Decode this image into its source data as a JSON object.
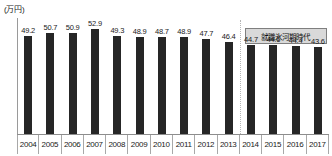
{
  "chart_data": {
    "type": "bar",
    "title": "",
    "subtitle": "",
    "xlabel": "",
    "ylabel": "",
    "unit_label": "(万円)",
    "categories": [
      "2004",
      "2005",
      "2006",
      "2007",
      "2008",
      "2009",
      "2010",
      "2011",
      "2012",
      "2013",
      "2014",
      "2015",
      "2016",
      "2017"
    ],
    "values": [
      49.2,
      50.7,
      50.9,
      52.9,
      49.3,
      48.9,
      48.7,
      48.9,
      47.7,
      46.4,
      44.7,
      44.6,
      44.4,
      43.6
    ],
    "value_labels": [
      "49.2",
      "50.7",
      "50.9",
      "52.9",
      "49.3",
      "48.9",
      "48.7",
      "48.9",
      "47.7",
      "46.4",
      "44.7",
      "44.6",
      "44.4",
      "43.6"
    ],
    "ylim": [
      0,
      52.9
    ],
    "grid": false,
    "legend": false,
    "bar_color": "#262626",
    "annotations": [
      {
        "text": "就職氷河期時代",
        "kind": "callout-box",
        "spans_categories": [
          "2014",
          "2017"
        ]
      }
    ],
    "dividers": [
      {
        "kind": "dotted-vertical",
        "between": [
          "2013",
          "2014"
        ]
      }
    ]
  },
  "axis": {
    "unit_caption": "(万円)"
  }
}
